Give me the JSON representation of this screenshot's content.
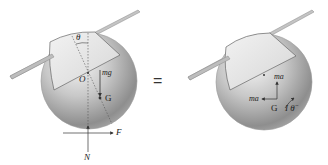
{
  "figure": {
    "equals_sign": "=",
    "left": {
      "labels": {
        "theta": "θ",
        "O": "O",
        "mg": "mg",
        "G": "G",
        "F": "F",
        "N": "N"
      }
    },
    "right": {
      "labels": {
        "ma_vertical": "ma",
        "ma_horizontal": "ma",
        "G": "G",
        "I_theta": "I θ̈"
      }
    }
  },
  "colors": {
    "ball_light": "#efefef",
    "ball_dark": "#8a8a8a",
    "rod": "#b9b9b9",
    "line": "#333333"
  }
}
